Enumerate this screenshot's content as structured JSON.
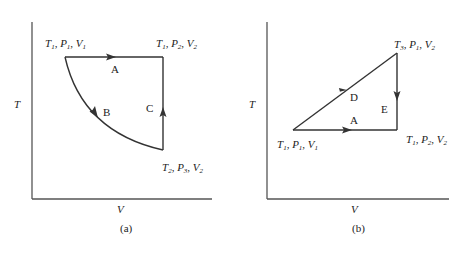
{
  "figure": {
    "panels": [
      {
        "id": "a",
        "caption": "(a)",
        "x_axis_label": "V",
        "y_axis_label": "T",
        "states": [
          {
            "T": "T",
            "T_sub": "1",
            "P": "P",
            "P_sub": "1",
            "V": "V",
            "V_sub": "1",
            "position": "top-left"
          },
          {
            "T": "T",
            "T_sub": "1",
            "P": "P",
            "P_sub": "2",
            "V": "V",
            "V_sub": "2",
            "position": "top-right"
          },
          {
            "T": "T",
            "T_sub": "2",
            "P": "P",
            "P_sub": "3",
            "V": "V",
            "V_sub": "2",
            "position": "bottom-right"
          }
        ],
        "paths": [
          {
            "label": "A",
            "from": "top-left",
            "to": "top-right",
            "shape": "horizontal line"
          },
          {
            "label": "B",
            "from": "top-left",
            "to": "bottom-right",
            "shape": "curve"
          },
          {
            "label": "C",
            "from": "bottom-right",
            "to": "top-right",
            "shape": "vertical line"
          }
        ]
      },
      {
        "id": "b",
        "caption": "(b)",
        "x_axis_label": "V",
        "y_axis_label": "T",
        "states": [
          {
            "T": "T",
            "T_sub": "1",
            "P": "P",
            "P_sub": "1",
            "V": "V",
            "V_sub": "1",
            "position": "bottom-left"
          },
          {
            "T": "T",
            "T_sub": "3",
            "P": "P",
            "P_sub": "1",
            "V": "V",
            "V_sub": "2",
            "position": "top-right"
          },
          {
            "T": "T",
            "T_sub": "1",
            "P": "P",
            "P_sub": "2",
            "V": "V",
            "V_sub": "2",
            "position": "bottom-right"
          }
        ],
        "paths": [
          {
            "label": "A",
            "from": "bottom-left",
            "to": "bottom-right",
            "shape": "horizontal line"
          },
          {
            "label": "D",
            "from": "bottom-left",
            "to": "top-right",
            "shape": "diagonal line"
          },
          {
            "label": "E",
            "from": "top-right",
            "to": "bottom-right",
            "shape": "vertical line"
          }
        ]
      }
    ]
  },
  "colors": {
    "line": "#333333",
    "axis": "#555555",
    "background": "#ffffff"
  }
}
